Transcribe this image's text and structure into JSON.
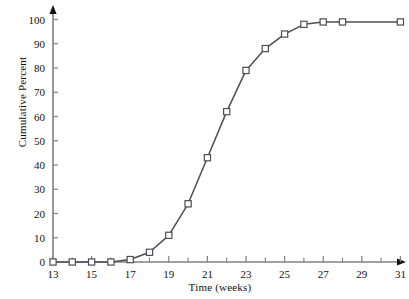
{
  "chart_data": {
    "type": "line",
    "title": "",
    "subtitle": "",
    "xlabel": "Time (weeks)",
    "ylabel": "Cumulative Percent",
    "xlim": [
      13,
      31
    ],
    "ylim": [
      0,
      100
    ],
    "xticks": [
      13,
      15,
      17,
      19,
      21,
      23,
      25,
      27,
      29,
      31
    ],
    "xtick_labels": [
      "13",
      "15",
      "17",
      "19",
      "21",
      "23",
      "25",
      "27",
      "29",
      "31"
    ],
    "xminorticks": [
      14,
      16,
      18,
      20,
      22,
      24,
      26,
      28,
      30
    ],
    "yticks": [
      0,
      10,
      20,
      30,
      40,
      50,
      60,
      70,
      80,
      90,
      100
    ],
    "ytick_labels": [
      "0",
      "10",
      "20",
      "30",
      "40",
      "50",
      "60",
      "70",
      "80",
      "90",
      "100"
    ],
    "grid": false,
    "legend": false,
    "legend_position": "none",
    "marker": "square-open",
    "line_color": "#4d4d55",
    "marker_edge_color": "#4d4d55",
    "marker_face_color": "#ffffff",
    "axis_color": "#808080",
    "x": [
      13,
      14,
      15,
      16,
      17,
      18,
      19,
      20,
      21,
      22,
      23,
      24,
      25,
      26,
      27,
      28,
      31
    ],
    "values": [
      0,
      0,
      0,
      0,
      1,
      4,
      11,
      24,
      43,
      62,
      79,
      88,
      94,
      98,
      99,
      99,
      99
    ],
    "series": [
      {
        "name": "Cumulative Percent",
        "x": [
          13,
          14,
          15,
          16,
          17,
          18,
          19,
          20,
          21,
          22,
          23,
          24,
          25,
          26,
          27,
          28,
          31
        ],
        "values": [
          0,
          0,
          0,
          0,
          1,
          4,
          11,
          24,
          43,
          62,
          79,
          88,
          94,
          98,
          99,
          99,
          99
        ]
      }
    ],
    "annotations": []
  }
}
